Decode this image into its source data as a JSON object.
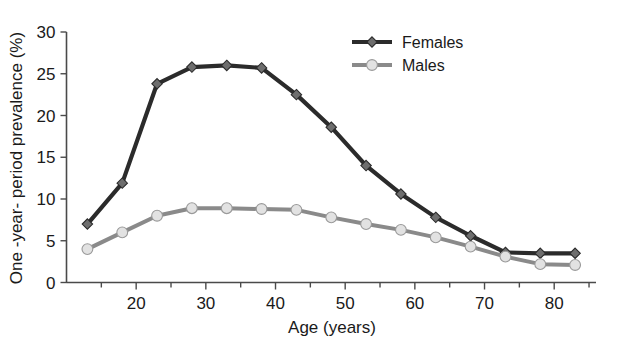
{
  "chart_data": {
    "type": "line",
    "title": "",
    "xlabel": "Age (years)",
    "ylabel": "One -year- period prevalence (%)",
    "xlim": [
      10,
      86
    ],
    "ylim": [
      0,
      30
    ],
    "xticks": [
      20,
      30,
      40,
      50,
      60,
      70,
      80
    ],
    "xtick_labels": [
      "20",
      "30",
      "40",
      "50",
      "60",
      "70",
      "80"
    ],
    "xminor_ticks": [
      15,
      25,
      35,
      45,
      55,
      65,
      75,
      85
    ],
    "yticks": [
      0,
      5,
      10,
      15,
      20,
      25,
      30
    ],
    "ytick_labels": [
      "0",
      "5",
      "10",
      "15",
      "20",
      "25",
      "30"
    ],
    "grid": false,
    "legend_position": "top-right",
    "x": [
      13,
      18,
      23,
      28,
      33,
      38,
      43,
      48,
      53,
      58,
      63,
      68,
      73,
      78,
      83
    ],
    "series": [
      {
        "name": "Females",
        "color": "#2b2b2b",
        "marker": "diamond",
        "marker_color": "#6e6e6e",
        "values": [
          7.0,
          11.9,
          23.8,
          25.8,
          26.0,
          25.7,
          22.5,
          18.6,
          14.0,
          10.6,
          7.8,
          5.6,
          3.6,
          3.5,
          3.5
        ]
      },
      {
        "name": "Males",
        "color": "#8a8a8a",
        "marker": "circle",
        "marker_color": "#e2e2e2",
        "values": [
          4.0,
          6.0,
          8.0,
          8.9,
          8.9,
          8.8,
          8.7,
          7.8,
          7.0,
          6.3,
          5.4,
          4.3,
          3.1,
          2.2,
          2.1
        ]
      }
    ]
  },
  "legend": {
    "items": [
      {
        "label": "Females"
      },
      {
        "label": "Males"
      }
    ]
  }
}
